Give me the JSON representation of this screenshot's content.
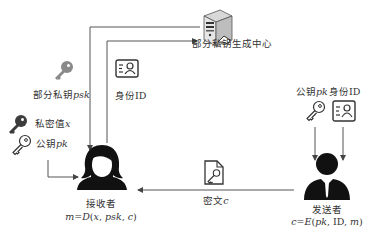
{
  "diagram": {
    "type": "certificateless encryption flow",
    "nodes": {
      "kgc": {
        "label": "部分私钥生成中心",
        "icon": "server-icon"
      },
      "receiver": {
        "label": "接收者",
        "formula": "m=D(x, psk, c)",
        "icon": "female-user-icon"
      },
      "sender": {
        "label": "发送者",
        "formula": "c=E(pk, ID, m)",
        "icon": "male-user-icon"
      }
    },
    "items": {
      "psk": {
        "label": "部分私钥psk",
        "icon": "key-icon"
      },
      "identity_top": {
        "label": "身份ID",
        "icon": "id-card-icon"
      },
      "secret": {
        "label": "私密值x",
        "icon": "key-icon"
      },
      "pk_receiver": {
        "label": "公钥pk",
        "icon": "key-outline-icon"
      },
      "pk_sender": {
        "label": "公钥pk",
        "icon": "key-outline-icon"
      },
      "identity_sender": {
        "label": "身份ID",
        "icon": "id-card-icon"
      },
      "ciphertext": {
        "label": "密文c",
        "icon": "document-key-icon"
      }
    },
    "edges": [
      {
        "from": "receiver",
        "to": "kgc",
        "label": "身份ID"
      },
      {
        "from": "kgc",
        "to": "receiver",
        "label": "部分私钥psk"
      },
      {
        "from": "pk_receiver",
        "to": "receiver"
      },
      {
        "from": "pk_sender",
        "to": "sender"
      },
      {
        "from": "identity_sender",
        "to": "sender"
      },
      {
        "from": "sender",
        "to": "receiver",
        "label": "密文c"
      }
    ]
  }
}
